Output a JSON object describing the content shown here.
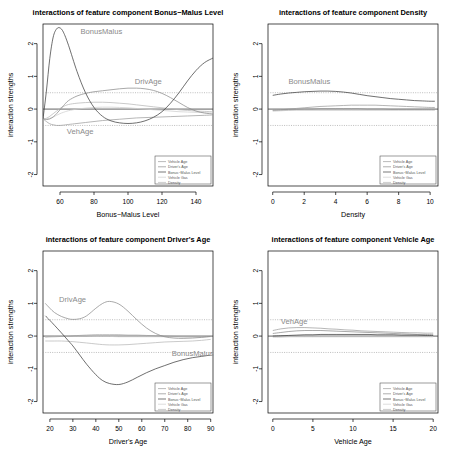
{
  "figure": {
    "background": "#ffffff",
    "legend_entries": [
      "Vehicle Age",
      "Driver's Age",
      "Bonus−Malus Level",
      "Vehicle Gas",
      "Density"
    ],
    "legend_colors": [
      "#9e9e9e",
      "#8c8c8c",
      "#3f3f3f",
      "#cfcfcf",
      "#b8b8b8"
    ],
    "reference_lines": [
      0.5,
      -0.5
    ],
    "zero_line": 0
  },
  "chart_data": [
    {
      "type": "line",
      "title": "interactions of feature component Bonus−Malus Level",
      "xlabel": "Bonus−Malus Level",
      "ylabel": "interaction strengths",
      "xlim": [
        50,
        150
      ],
      "ylim": [
        -2.35,
        2.6
      ],
      "xticks": [
        60,
        80,
        100,
        120,
        140
      ],
      "yticks": [
        -2,
        -1,
        0,
        1,
        2
      ],
      "grid": false,
      "legend_position": "bottom-right",
      "annotations": [
        {
          "text": "BonusMalus",
          "x": 72,
          "y": 2.28
        },
        {
          "text": "DrivAge",
          "x": 104,
          "y": 0.78
        },
        {
          "text": "VehAge",
          "x": 64,
          "y": -0.76
        }
      ],
      "x": [
        50,
        52,
        54,
        56,
        58,
        60,
        62,
        65,
        70,
        75,
        80,
        85,
        90,
        95,
        100,
        105,
        110,
        115,
        120,
        125,
        130,
        135,
        140,
        145,
        150
      ],
      "series": [
        {
          "name": "Vehicle Age",
          "color": "#9e9e9e",
          "values": [
            -0.3,
            -0.38,
            -0.45,
            -0.48,
            -0.5,
            -0.5,
            -0.49,
            -0.47,
            -0.44,
            -0.41,
            -0.38,
            -0.35,
            -0.33,
            -0.31,
            -0.29,
            -0.27,
            -0.26,
            -0.25,
            -0.24,
            -0.23,
            -0.22,
            -0.21,
            -0.2,
            -0.19,
            -0.18
          ]
        },
        {
          "name": "Driver's Age",
          "color": "#8c8c8c",
          "values": [
            -0.3,
            -0.32,
            -0.3,
            -0.24,
            -0.14,
            -0.02,
            0.1,
            0.26,
            0.4,
            0.48,
            0.53,
            0.56,
            0.59,
            0.62,
            0.64,
            0.64,
            0.62,
            0.57,
            0.48,
            0.35,
            0.2,
            0.05,
            -0.06,
            -0.12,
            -0.15
          ]
        },
        {
          "name": "Bonus−Malus Level",
          "color": "#3f3f3f",
          "values": [
            -0.3,
            0.55,
            1.55,
            2.2,
            2.45,
            2.48,
            2.35,
            1.95,
            1.15,
            0.5,
            0.05,
            -0.22,
            -0.36,
            -0.42,
            -0.44,
            -0.42,
            -0.36,
            -0.25,
            -0.08,
            0.18,
            0.5,
            0.86,
            1.18,
            1.42,
            1.56
          ]
        },
        {
          "name": "Vehicle Gas",
          "color": "#cfcfcf",
          "values": [
            -0.3,
            -0.3,
            -0.28,
            -0.24,
            -0.19,
            -0.14,
            -0.1,
            -0.05,
            0.0,
            0.03,
            0.05,
            0.06,
            0.06,
            0.05,
            0.04,
            0.02,
            0.0,
            -0.02,
            -0.04,
            -0.06,
            -0.08,
            -0.09,
            -0.1,
            -0.11,
            -0.12
          ]
        },
        {
          "name": "Density",
          "color": "#b8b8b8",
          "values": [
            -0.3,
            -0.28,
            -0.22,
            -0.14,
            -0.06,
            0.02,
            0.08,
            0.14,
            0.18,
            0.2,
            0.21,
            0.21,
            0.2,
            0.18,
            0.16,
            0.13,
            0.1,
            0.07,
            0.04,
            0.01,
            -0.02,
            -0.04,
            -0.06,
            -0.07,
            -0.08
          ]
        }
      ]
    },
    {
      "type": "line",
      "title": "interactions of feature component Density",
      "xlabel": "Density",
      "ylabel": "interaction strengths",
      "xlim": [
        -0.3,
        10.5
      ],
      "ylim": [
        -2.35,
        2.6
      ],
      "xticks": [
        0,
        2,
        4,
        6,
        8,
        10
      ],
      "yticks": [
        -2,
        -1,
        0,
        1,
        2
      ],
      "grid": false,
      "legend_position": "bottom-right",
      "annotations": [
        {
          "text": "BonusMalus",
          "x": 1.0,
          "y": 0.76
        }
      ],
      "x": [
        0,
        0.5,
        1,
        1.5,
        2,
        2.5,
        3,
        3.5,
        4,
        4.5,
        5,
        5.5,
        6,
        6.5,
        7,
        7.5,
        8,
        8.5,
        9,
        9.5,
        10,
        10.3
      ],
      "series": [
        {
          "name": "Vehicle Age",
          "color": "#9e9e9e",
          "values": [
            -0.04,
            -0.02,
            0.0,
            0.02,
            0.04,
            0.06,
            0.08,
            0.09,
            0.1,
            0.11,
            0.12,
            0.12,
            0.12,
            0.12,
            0.11,
            0.1,
            0.09,
            0.08,
            0.07,
            0.06,
            0.05,
            0.05
          ]
        },
        {
          "name": "Driver's Age",
          "color": "#8c8c8c",
          "values": [
            -0.02,
            -0.02,
            -0.01,
            -0.01,
            0.0,
            0.0,
            0.01,
            0.01,
            0.01,
            0.01,
            0.01,
            0.01,
            0.0,
            0.0,
            0.0,
            -0.01,
            -0.01,
            -0.01,
            -0.01,
            -0.01,
            -0.01,
            -0.01
          ]
        },
        {
          "name": "Bonus−Malus Level",
          "color": "#3f3f3f",
          "values": [
            0.42,
            0.46,
            0.49,
            0.51,
            0.53,
            0.54,
            0.55,
            0.55,
            0.54,
            0.52,
            0.49,
            0.45,
            0.41,
            0.38,
            0.35,
            0.32,
            0.3,
            0.28,
            0.26,
            0.25,
            0.24,
            0.24
          ]
        },
        {
          "name": "Vehicle Gas",
          "color": "#cfcfcf",
          "values": [
            -0.02,
            -0.02,
            -0.02,
            -0.02,
            -0.02,
            -0.02,
            -0.02,
            -0.02,
            -0.02,
            -0.02,
            -0.02,
            -0.02,
            -0.02,
            -0.02,
            -0.02,
            -0.02,
            -0.02,
            -0.02,
            -0.02,
            -0.02,
            -0.02,
            -0.02
          ]
        },
        {
          "name": "Density",
          "color": "#b8b8b8",
          "values": [
            -0.06,
            -0.05,
            -0.04,
            -0.03,
            -0.03,
            -0.03,
            -0.03,
            -0.03,
            -0.03,
            -0.03,
            -0.03,
            -0.03,
            -0.03,
            -0.03,
            -0.03,
            -0.03,
            -0.03,
            -0.03,
            -0.03,
            -0.03,
            -0.03,
            -0.03
          ]
        }
      ]
    },
    {
      "type": "line",
      "title": "interactions of feature component Driver's Age",
      "xlabel": "Driver's Age",
      "ylabel": "interaction strengths",
      "xlim": [
        17,
        91
      ],
      "ylim": [
        -2.35,
        2.6
      ],
      "xticks": [
        20,
        30,
        40,
        50,
        60,
        70,
        80,
        90
      ],
      "yticks": [
        -2,
        -1,
        0,
        1,
        2
      ],
      "grid": false,
      "legend_position": "bottom-right",
      "annotations": [
        {
          "text": "DrivAge",
          "x": 24,
          "y": 1.05
        },
        {
          "text": "BonusMalus",
          "x": 73,
          "y": -0.62
        }
      ],
      "x": [
        18,
        20,
        22,
        25,
        28,
        30,
        33,
        36,
        40,
        43,
        46,
        50,
        54,
        58,
        62,
        66,
        70,
        74,
        78,
        82,
        86,
        90
      ],
      "series": [
        {
          "name": "Vehicle Age",
          "color": "#9e9e9e",
          "values": [
            -0.03,
            -0.02,
            -0.02,
            -0.01,
            0.0,
            0.01,
            0.02,
            0.03,
            0.04,
            0.04,
            0.04,
            0.04,
            0.03,
            0.03,
            0.02,
            0.01,
            0.0,
            -0.01,
            -0.02,
            -0.02,
            -0.02,
            -0.01
          ]
        },
        {
          "name": "Driver's Age",
          "color": "#8c8c8c",
          "values": [
            1.0,
            0.85,
            0.72,
            0.6,
            0.53,
            0.51,
            0.53,
            0.62,
            0.85,
            1.0,
            1.06,
            0.98,
            0.76,
            0.49,
            0.25,
            0.08,
            -0.02,
            -0.06,
            -0.07,
            -0.06,
            -0.04,
            -0.01
          ]
        },
        {
          "name": "Bonus−Malus Level",
          "color": "#3f3f3f",
          "values": [
            0.62,
            0.48,
            0.33,
            0.1,
            -0.14,
            -0.3,
            -0.58,
            -0.86,
            -1.18,
            -1.36,
            -1.45,
            -1.48,
            -1.4,
            -1.26,
            -1.12,
            -1.0,
            -0.9,
            -0.8,
            -0.72,
            -0.66,
            -0.62,
            -0.58
          ]
        },
        {
          "name": "Vehicle Gas",
          "color": "#cfcfcf",
          "values": [
            -0.02,
            -0.02,
            -0.01,
            -0.01,
            0.0,
            0.0,
            0.0,
            0.0,
            -0.01,
            -0.01,
            -0.01,
            -0.02,
            -0.02,
            -0.02,
            -0.02,
            -0.02,
            -0.02,
            -0.02,
            -0.02,
            -0.02,
            -0.02,
            -0.02
          ]
        },
        {
          "name": "Density",
          "color": "#b8b8b8",
          "values": [
            -0.15,
            -0.15,
            -0.15,
            -0.15,
            -0.16,
            -0.17,
            -0.19,
            -0.21,
            -0.24,
            -0.26,
            -0.27,
            -0.27,
            -0.26,
            -0.24,
            -0.22,
            -0.2,
            -0.18,
            -0.17,
            -0.16,
            -0.15,
            -0.13,
            -0.1
          ]
        }
      ]
    },
    {
      "type": "line",
      "title": "interactions of feature component Vehicle Age",
      "xlabel": "Vehicle Age",
      "ylabel": "interaction strengths",
      "xlim": [
        -0.6,
        20.6
      ],
      "ylim": [
        -2.35,
        2.6
      ],
      "xticks": [
        0,
        5,
        10,
        15,
        20
      ],
      "yticks": [
        -2,
        -1,
        0,
        1,
        2
      ],
      "grid": false,
      "legend_position": "bottom-right",
      "annotations": [
        {
          "text": "VehAge",
          "x": 1.0,
          "y": 0.36
        }
      ],
      "x": [
        0,
        1,
        2,
        3,
        4,
        5,
        6,
        7,
        8,
        9,
        10,
        11,
        12,
        13,
        14,
        15,
        16,
        17,
        18,
        19,
        20
      ],
      "series": [
        {
          "name": "Vehicle Age",
          "color": "#9e9e9e",
          "values": [
            0.17,
            0.22,
            0.25,
            0.26,
            0.26,
            0.25,
            0.24,
            0.22,
            0.21,
            0.19,
            0.18,
            0.16,
            0.15,
            0.14,
            0.13,
            0.12,
            0.11,
            0.1,
            0.1,
            0.09,
            0.09
          ]
        },
        {
          "name": "Driver's Age",
          "color": "#8c8c8c",
          "values": [
            0.08,
            0.11,
            0.14,
            0.16,
            0.17,
            0.17,
            0.17,
            0.16,
            0.15,
            0.14,
            0.13,
            0.12,
            0.11,
            0.1,
            0.09,
            0.08,
            0.07,
            0.06,
            0.05,
            0.05,
            0.04
          ]
        },
        {
          "name": "Bonus−Malus Level",
          "color": "#3f3f3f",
          "values": [
            0.0,
            0.01,
            0.02,
            0.03,
            0.04,
            0.04,
            0.05,
            0.05,
            0.05,
            0.05,
            0.05,
            0.05,
            0.05,
            0.04,
            0.04,
            0.04,
            0.03,
            0.03,
            0.03,
            0.02,
            0.02
          ]
        },
        {
          "name": "Vehicle Gas",
          "color": "#cfcfcf",
          "values": [
            -0.01,
            -0.01,
            -0.01,
            -0.01,
            -0.01,
            -0.01,
            -0.01,
            -0.01,
            -0.01,
            -0.01,
            -0.01,
            -0.01,
            -0.01,
            -0.01,
            -0.01,
            -0.01,
            -0.01,
            -0.01,
            -0.01,
            -0.01,
            -0.01
          ]
        },
        {
          "name": "Density",
          "color": "#b8b8b8",
          "values": [
            -0.03,
            -0.03,
            -0.02,
            -0.02,
            -0.02,
            -0.02,
            -0.02,
            -0.02,
            -0.02,
            -0.02,
            -0.02,
            -0.02,
            -0.02,
            -0.02,
            -0.02,
            -0.02,
            -0.02,
            -0.02,
            -0.02,
            -0.02,
            -0.02
          ]
        }
      ]
    }
  ]
}
